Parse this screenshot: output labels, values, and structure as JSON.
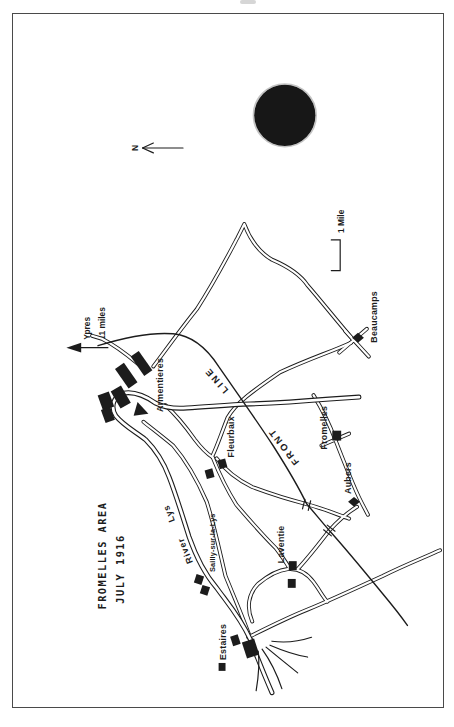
{
  "page": {
    "type": "scanned book map page",
    "ink_color": "#1c1c1c",
    "paper_color": "#ffffff"
  },
  "map": {
    "title": {
      "line1": "FROMELLES  AREA",
      "line2": "JULY  1916"
    },
    "compass": {
      "label": "N"
    },
    "scale": {
      "label": "1 Mile"
    },
    "direction_pointer": {
      "destination": "Ypres",
      "distance": "11 miles"
    },
    "front_line": {
      "word1": "FRONT",
      "word2": "LINE"
    },
    "river": {
      "word1": "River",
      "word2": "Lys"
    },
    "places": [
      {
        "name": "Armentieres",
        "marker": "town-blocks"
      },
      {
        "name": "Beaucamps",
        "marker": "diamond"
      },
      {
        "name": "Fromelles",
        "marker": "square"
      },
      {
        "name": "Fleurbaix",
        "marker": "two-squares"
      },
      {
        "name": "Aubers",
        "marker": "diamond"
      },
      {
        "name": "Laventie",
        "marker": "two-squares"
      },
      {
        "name": "Sailly-sur-la-Lys",
        "marker": "two-squares"
      },
      {
        "name": "Estaires",
        "marker": "town-blocks"
      }
    ],
    "punch_hole_color": "#171717"
  }
}
